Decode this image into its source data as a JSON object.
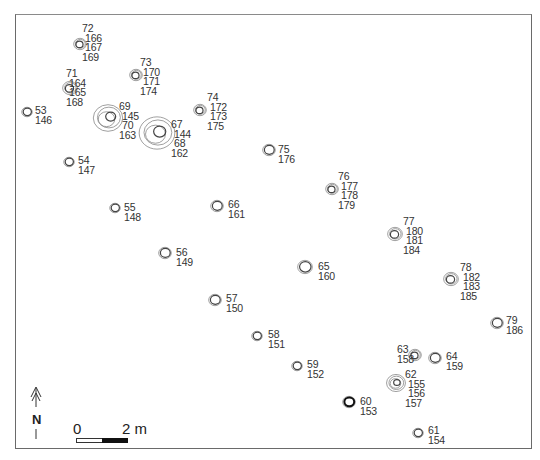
{
  "map": {
    "frame": {
      "left": 15,
      "top": 14,
      "right": 532,
      "bottom": 449
    },
    "features": [
      {
        "id": "72",
        "x": 80,
        "y": 44,
        "r": 6,
        "rings": 3,
        "labels": [
          "72",
          "166",
          "167",
          "169"
        ],
        "lx": 82,
        "ly": 24,
        "align": [
          "l",
          "i",
          "i",
          "l"
        ]
      },
      {
        "id": "71",
        "x": 70,
        "y": 88,
        "r": 7,
        "rings": 3,
        "labels": [
          "71",
          "164",
          "165",
          "168"
        ],
        "lx": 66,
        "ly": 69
      },
      {
        "id": "73",
        "x": 136,
        "y": 75,
        "r": 6,
        "rings": 3,
        "labels": [
          "73",
          "170",
          "171",
          "174"
        ],
        "lx": 140,
        "ly": 58
      },
      {
        "id": "53",
        "x": 27,
        "y": 112,
        "r": 5,
        "rings": 2,
        "labels": [
          "53",
          "146"
        ],
        "lx": 35,
        "ly": 106
      },
      {
        "id": "69",
        "x": 108,
        "y": 118,
        "r": 14,
        "rings": 4,
        "labels": [
          "69",
          "145",
          "70",
          "163"
        ],
        "lx": 119,
        "ly": 102
      },
      {
        "id": "67",
        "x": 157,
        "y": 133,
        "r": 17,
        "rings": 4,
        "labels": [
          "67",
          "144",
          "68",
          "162"
        ],
        "lx": 171,
        "ly": 120
      },
      {
        "id": "74",
        "x": 200,
        "y": 110,
        "r": 6,
        "rings": 3,
        "labels": [
          "74",
          "172",
          "173",
          "175"
        ],
        "lx": 207,
        "ly": 93
      },
      {
        "id": "54",
        "x": 69,
        "y": 162,
        "r": 5,
        "rings": 2,
        "labels": [
          "54",
          "147"
        ],
        "lx": 78,
        "ly": 156
      },
      {
        "id": "75",
        "x": 269,
        "y": 150,
        "r": 6,
        "rings": 2,
        "labels": [
          "75",
          "176"
        ],
        "lx": 278,
        "ly": 145
      },
      {
        "id": "76",
        "x": 332,
        "y": 189,
        "r": 6,
        "rings": 3,
        "labels": [
          "76",
          "177",
          "178",
          "179"
        ],
        "lx": 338,
        "ly": 172
      },
      {
        "id": "55",
        "x": 115,
        "y": 208,
        "r": 5,
        "rings": 2,
        "labels": [
          "55",
          "148"
        ],
        "lx": 124,
        "ly": 203
      },
      {
        "id": "66",
        "x": 217,
        "y": 206,
        "r": 6,
        "rings": 2,
        "labels": [
          "66",
          "161"
        ],
        "lx": 228,
        "ly": 200
      },
      {
        "id": "77",
        "x": 395,
        "y": 234,
        "r": 7,
        "rings": 3,
        "labels": [
          "77",
          "180",
          "181",
          "184"
        ],
        "lx": 403,
        "ly": 217
      },
      {
        "id": "56",
        "x": 165,
        "y": 253,
        "r": 6,
        "rings": 2,
        "labels": [
          "56",
          "149"
        ],
        "lx": 176,
        "ly": 248
      },
      {
        "id": "65",
        "x": 305,
        "y": 267,
        "r": 7,
        "rings": 2,
        "labels": [
          "65",
          "160"
        ],
        "lx": 318,
        "ly": 262
      },
      {
        "id": "78",
        "x": 451,
        "y": 279,
        "r": 7,
        "rings": 3,
        "labels": [
          "78",
          "182",
          "183",
          "185"
        ],
        "lx": 460,
        "ly": 263
      },
      {
        "id": "57",
        "x": 215,
        "y": 300,
        "r": 6,
        "rings": 2,
        "labels": [
          "57",
          "150"
        ],
        "lx": 226,
        "ly": 294
      },
      {
        "id": "79",
        "x": 497,
        "y": 323,
        "r": 6,
        "rings": 2,
        "labels": [
          "79",
          "186"
        ],
        "lx": 506,
        "ly": 316
      },
      {
        "id": "58",
        "x": 257,
        "y": 336,
        "r": 5,
        "rings": 2,
        "labels": [
          "58",
          "151"
        ],
        "lx": 268,
        "ly": 330
      },
      {
        "id": "63",
        "x": 415,
        "y": 355,
        "r": 6,
        "rings": 3,
        "labels": [
          "63",
          "158"
        ],
        "lx": 397,
        "ly": 345,
        "left": true
      },
      {
        "id": "64",
        "x": 435,
        "y": 358,
        "r": 6,
        "rings": 2,
        "labels": [
          "64",
          "159"
        ],
        "lx": 446,
        "ly": 352
      },
      {
        "id": "59",
        "x": 297,
        "y": 366,
        "r": 5,
        "rings": 2,
        "labels": [
          "59",
          "152"
        ],
        "lx": 307,
        "ly": 360
      },
      {
        "id": "62",
        "x": 396,
        "y": 383,
        "r": 9,
        "rings": 4,
        "labels": [
          "62",
          "155",
          "156",
          "157"
        ],
        "lx": 405,
        "ly": 370
      },
      {
        "id": "60",
        "x": 349,
        "y": 402,
        "r": 6,
        "rings": 2,
        "labels": [
          "60",
          "153"
        ],
        "lx": 360,
        "ly": 397,
        "bold": true
      },
      {
        "id": "61",
        "x": 418,
        "y": 433,
        "r": 5,
        "rings": 2,
        "labels": [
          "61",
          "154"
        ],
        "lx": 428,
        "ly": 426
      }
    ]
  },
  "north_arrow": {
    "label": "N"
  },
  "scale_bar": {
    "start_label": "0",
    "end_label": "2 m"
  }
}
